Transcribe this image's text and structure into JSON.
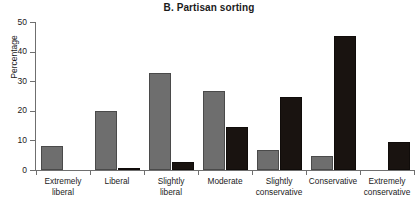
{
  "chart_data": {
    "type": "bar",
    "title": "B. Partisan sorting",
    "xlabel": "",
    "ylabel": "Percentage",
    "ylim": [
      0,
      50
    ],
    "yticks": [
      0,
      10,
      20,
      30,
      40,
      50
    ],
    "ytick_labels": [
      "0",
      "10",
      "20",
      "30",
      "40",
      "50"
    ],
    "grid": false,
    "legend": "none",
    "categories": [
      "Extremely liberal",
      "Liberal",
      "Slightly liberal",
      "Moderate",
      "Slightly conservative",
      "Conservative",
      "Extremely conservative"
    ],
    "category_lines": [
      [
        "Extremely",
        "liberal"
      ],
      [
        "Liberal",
        ""
      ],
      [
        "Slightly",
        "liberal"
      ],
      [
        "Moderate",
        ""
      ],
      [
        "Slightly",
        "conservative"
      ],
      [
        "Conservative",
        ""
      ],
      [
        "Extremely",
        "conservative"
      ]
    ],
    "series": [
      {
        "name": "Series A",
        "color": "#6e6e6e",
        "values": [
          8.0,
          20.0,
          32.9,
          26.7,
          6.6,
          4.6,
          0.0
        ]
      },
      {
        "name": "Series B",
        "color": "#191310",
        "values": [
          0.0,
          0.7,
          2.6,
          14.5,
          24.5,
          45.3,
          9.4
        ]
      }
    ]
  },
  "colors": {
    "series_a": "#6e6e6e",
    "series_b": "#191310",
    "axis": "#6f6f6f",
    "text": "#1b1b1b",
    "background": "#ffffff"
  }
}
